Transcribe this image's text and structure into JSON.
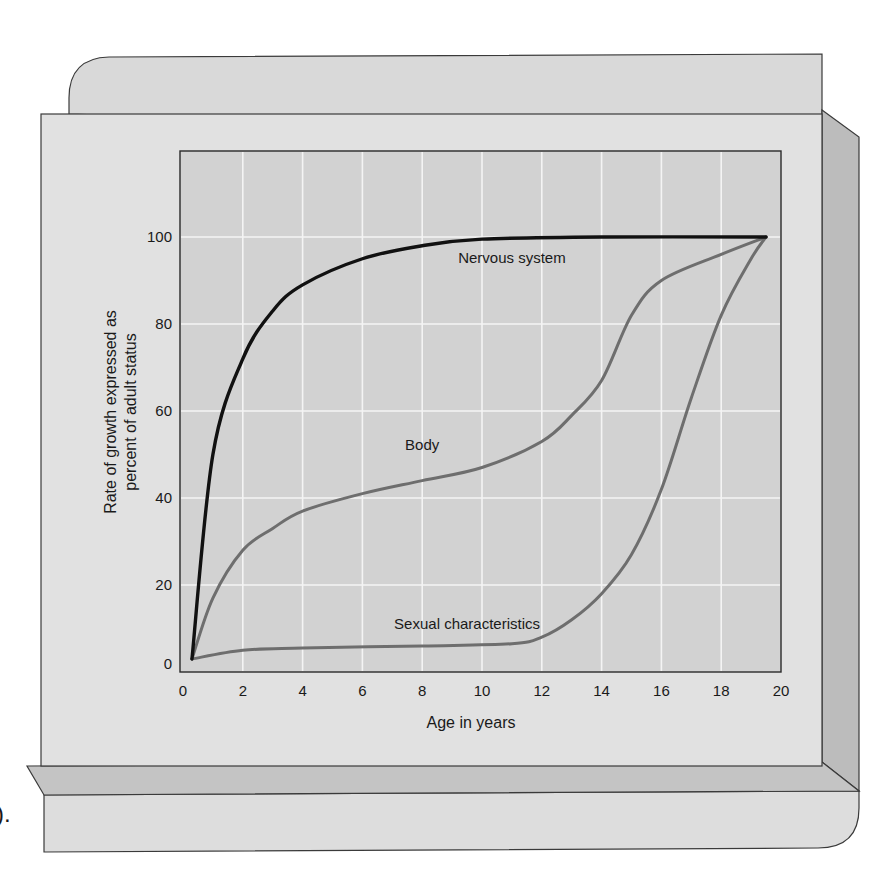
{
  "chart_data": {
    "type": "line",
    "title": "",
    "xlabel": "Age in years",
    "ylabel": "Rate of growth expressed as percent of adult status",
    "ylabel_lines": [
      "Rate of growth expressed as",
      "percent of adult status"
    ],
    "xlim": [
      0,
      20
    ],
    "ylim": [
      0,
      120
    ],
    "x_ticks": [
      0,
      2,
      4,
      6,
      8,
      10,
      12,
      14,
      16,
      18,
      20
    ],
    "y_ticks": [
      0,
      20,
      40,
      60,
      80,
      100
    ],
    "grid": true,
    "legend": "inline labels",
    "series": [
      {
        "name": "Nervous system",
        "color": "#111111",
        "x": [
          0.3,
          1,
          2,
          3,
          4,
          6,
          8,
          10,
          14,
          19.5
        ],
        "values": [
          3,
          50,
          72,
          83,
          89,
          95,
          98,
          99.5,
          100,
          100
        ]
      },
      {
        "name": "Body",
        "color": "#6e6e6e",
        "x": [
          0.3,
          1,
          2,
          3,
          4,
          6,
          8,
          10,
          12,
          13,
          14,
          15,
          16,
          18,
          19.5
        ],
        "values": [
          3,
          17,
          28,
          33,
          37,
          41,
          44,
          47,
          53,
          59,
          67,
          82,
          90,
          96,
          100
        ]
      },
      {
        "name": "Sexual characteristics",
        "color": "#6e6e6e",
        "x": [
          0.3,
          2,
          4,
          8,
          11,
          12,
          13,
          14,
          15,
          16,
          17,
          18,
          19,
          19.5
        ],
        "values": [
          3,
          5,
          5.5,
          6,
          6.5,
          8,
          12,
          18,
          27,
          42,
          63,
          82,
          95,
          100
        ]
      }
    ],
    "annotations": [
      {
        "text": "Nervous system",
        "x": 11,
        "y": 94
      },
      {
        "text": "Body",
        "x": 8,
        "y": 51
      },
      {
        "text": "Sexual characteristics",
        "x": 9.5,
        "y": 10
      }
    ]
  },
  "frame": {
    "caption_fragment": ")."
  },
  "colors": {
    "panel": "#dcdcdc",
    "panel_light": "#e2e2e2",
    "plot_bg": "#d2d2d2",
    "grid": "#f4f4f4",
    "bevel_dark": "#bcbcbc",
    "outline": "#3a3a3a"
  }
}
